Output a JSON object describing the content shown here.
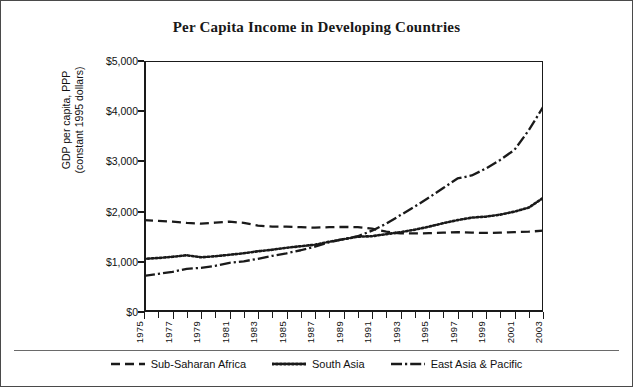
{
  "chart_data": {
    "type": "line",
    "title": "Per Capita Income in Developing Countries",
    "xlabel": "",
    "ylabel": "GDP per capita, PPP\n(constant 1995 dollars)",
    "ylim": [
      0,
      5000
    ],
    "xlim": [
      1975,
      2003
    ],
    "grid": false,
    "legend_position": "bottom",
    "ytick_labels": [
      "$5,000",
      "$4,000",
      "$3,000",
      "$2,000",
      "$1,000",
      "$0"
    ],
    "ytick_values": [
      5000,
      4000,
      3000,
      2000,
      1000,
      0
    ],
    "xtick_labels": [
      "1975",
      "1977",
      "1979",
      "1981",
      "1983",
      "1985",
      "1987",
      "1989",
      "1991",
      "1993",
      "1995",
      "1997",
      "1999",
      "2001",
      "2003"
    ],
    "xtick_values": [
      1975,
      1977,
      1979,
      1981,
      1983,
      1985,
      1987,
      1989,
      1991,
      1993,
      1995,
      1997,
      1999,
      2001,
      2003
    ],
    "x": [
      1975,
      1976,
      1977,
      1978,
      1979,
      1980,
      1981,
      1982,
      1983,
      1984,
      1985,
      1986,
      1987,
      1988,
      1989,
      1990,
      1991,
      1992,
      1993,
      1994,
      1995,
      1996,
      1997,
      1998,
      1999,
      2000,
      2001,
      2002,
      2003
    ],
    "series": [
      {
        "name": "Sub-Saharan Africa",
        "dash": "dashed",
        "color": "#1a1a1a",
        "values": [
          1830,
          1815,
          1800,
          1775,
          1760,
          1780,
          1800,
          1775,
          1720,
          1700,
          1700,
          1690,
          1680,
          1690,
          1695,
          1690,
          1660,
          1600,
          1565,
          1565,
          1570,
          1580,
          1590,
          1580,
          1575,
          1580,
          1590,
          1600,
          1620
        ]
      },
      {
        "name": "South Asia",
        "dash": "dotted",
        "color": "#1a1a1a",
        "values": [
          1060,
          1075,
          1100,
          1130,
          1090,
          1110,
          1140,
          1170,
          1210,
          1240,
          1280,
          1310,
          1340,
          1400,
          1450,
          1500,
          1510,
          1550,
          1590,
          1640,
          1700,
          1770,
          1830,
          1880,
          1900,
          1940,
          2000,
          2080,
          2270
        ]
      },
      {
        "name": "East Asia & Pacific",
        "dash": "dashdot",
        "color": "#1a1a1a",
        "values": [
          720,
          760,
          800,
          860,
          880,
          920,
          980,
          1010,
          1060,
          1120,
          1170,
          1230,
          1300,
          1390,
          1450,
          1510,
          1620,
          1760,
          1930,
          2100,
          2280,
          2470,
          2660,
          2720,
          2860,
          3030,
          3230,
          3620,
          4080
        ]
      }
    ]
  },
  "legend": {
    "items": [
      {
        "label": "Sub-Saharan Africa",
        "style": "dashed"
      },
      {
        "label": "South Asia",
        "style": "dotted"
      },
      {
        "label": "East Asia & Pacific",
        "style": "dashdot"
      }
    ]
  }
}
